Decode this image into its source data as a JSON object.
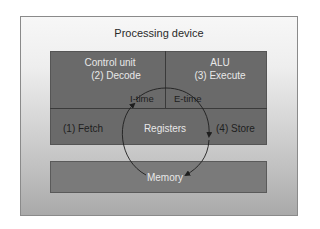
{
  "diagram": {
    "title": "Processing device",
    "blocks": {
      "control_unit": {
        "label": "Control unit",
        "step": "(2) Decode"
      },
      "alu": {
        "label": "ALU",
        "step": "(3) Execute"
      },
      "registers": {
        "label": "Registers",
        "left_step": "(1) Fetch",
        "right_step": "(4) Store"
      },
      "memory": {
        "label": "Memory"
      }
    },
    "cycle_labels": {
      "i_time": "I-time",
      "e_time": "E-time"
    },
    "colors": {
      "cpu_block": "#6a6a6a",
      "memory_block": "#7a7a7a",
      "text_light": "#e8e8e8",
      "arrow": "#1e1e1e"
    }
  }
}
